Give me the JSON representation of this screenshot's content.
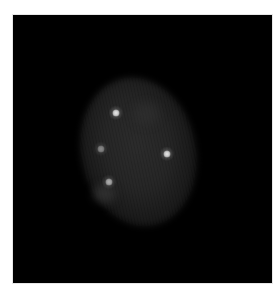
{
  "image": {
    "kind": "fluorescence micrograph",
    "background_color": "#000000",
    "frame": {
      "x": 13,
      "y": 15,
      "width": 259,
      "height": 268
    },
    "nucleus": {
      "center_x": 138,
      "center_y": 152,
      "width": 115,
      "height": 150,
      "rotation_deg": -12,
      "color": "#2a2a2a"
    },
    "spots": [
      {
        "id": 1,
        "x": 116,
        "y": 113,
        "size": 7,
        "intensity": "bright",
        "color": "#e8e8e8"
      },
      {
        "id": 2,
        "x": 167,
        "y": 154,
        "size": 7,
        "intensity": "bright",
        "color": "#e6e6e6"
      },
      {
        "id": 3,
        "x": 101,
        "y": 149,
        "size": 7,
        "intensity": "dim",
        "color": "#8a8a8a"
      },
      {
        "id": 4,
        "x": 109,
        "y": 182,
        "size": 7,
        "intensity": "medium",
        "color": "#b0b0b0"
      }
    ]
  }
}
